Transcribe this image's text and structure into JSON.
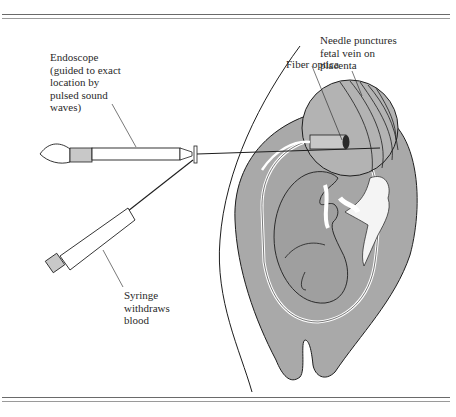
{
  "figure": {
    "colors": {
      "uterus_fill": "#a9a9a9",
      "line": "#1e1e1e",
      "rule": "#6a6a6a",
      "background": "#ffffff"
    },
    "labels": {
      "endoscope": "Endoscope\n(guided to exact\nlocation by\npulsed sound\nwaves)",
      "needle": "Needle punctures\nfetal vein on\nplacenta",
      "fiber": "Fiber optica",
      "syringe": "Syringe\nwithdraws\nblood"
    },
    "components": [
      "hand",
      "endoscope",
      "syringe",
      "needle",
      "abdomen",
      "uterus",
      "fetus",
      "placenta",
      "magnified-inset"
    ]
  }
}
